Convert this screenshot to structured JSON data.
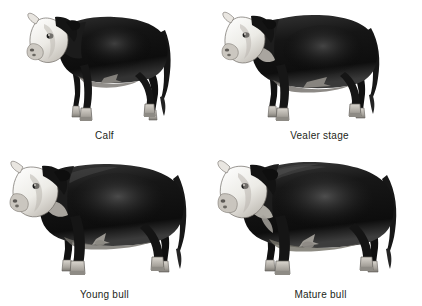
{
  "figure": {
    "background_color": "#ffffff",
    "caption_color": "#231f20",
    "layout": "2x2 grid of cattle growth-stage illustrations",
    "palette": {
      "body_dark": "#1a1a1a",
      "body_mid": "#3d3d3d",
      "body_shade": "#606060",
      "face_white": "#f2f0ec",
      "face_shadow": "#cfcbc4",
      "hoof_light": "#b8b4ad",
      "hoof_dark": "#8a8680",
      "outline": "#111111"
    }
  },
  "panels": [
    {
      "id": "calf",
      "label": "Calf",
      "subject": "calf-illustration",
      "body_build": "slender, long-legged juvenile",
      "pose": "standing, head turned toward viewer"
    },
    {
      "id": "vealer",
      "label": "Vealer stage",
      "subject": "vealer-illustration",
      "body_build": "filled-out yearling, deeper barrel",
      "pose": "standing, head turned toward viewer"
    },
    {
      "id": "young-bull",
      "label": "Young bull",
      "subject": "young-bull-illustration",
      "body_build": "muscular, blocky, developing crest",
      "pose": "standing, head turned toward viewer"
    },
    {
      "id": "mature-bull",
      "label": "Mature bull",
      "subject": "mature-bull-illustration",
      "body_build": "heavy, thick neck crest, broad shoulders",
      "pose": "standing, head turned toward viewer"
    }
  ]
}
